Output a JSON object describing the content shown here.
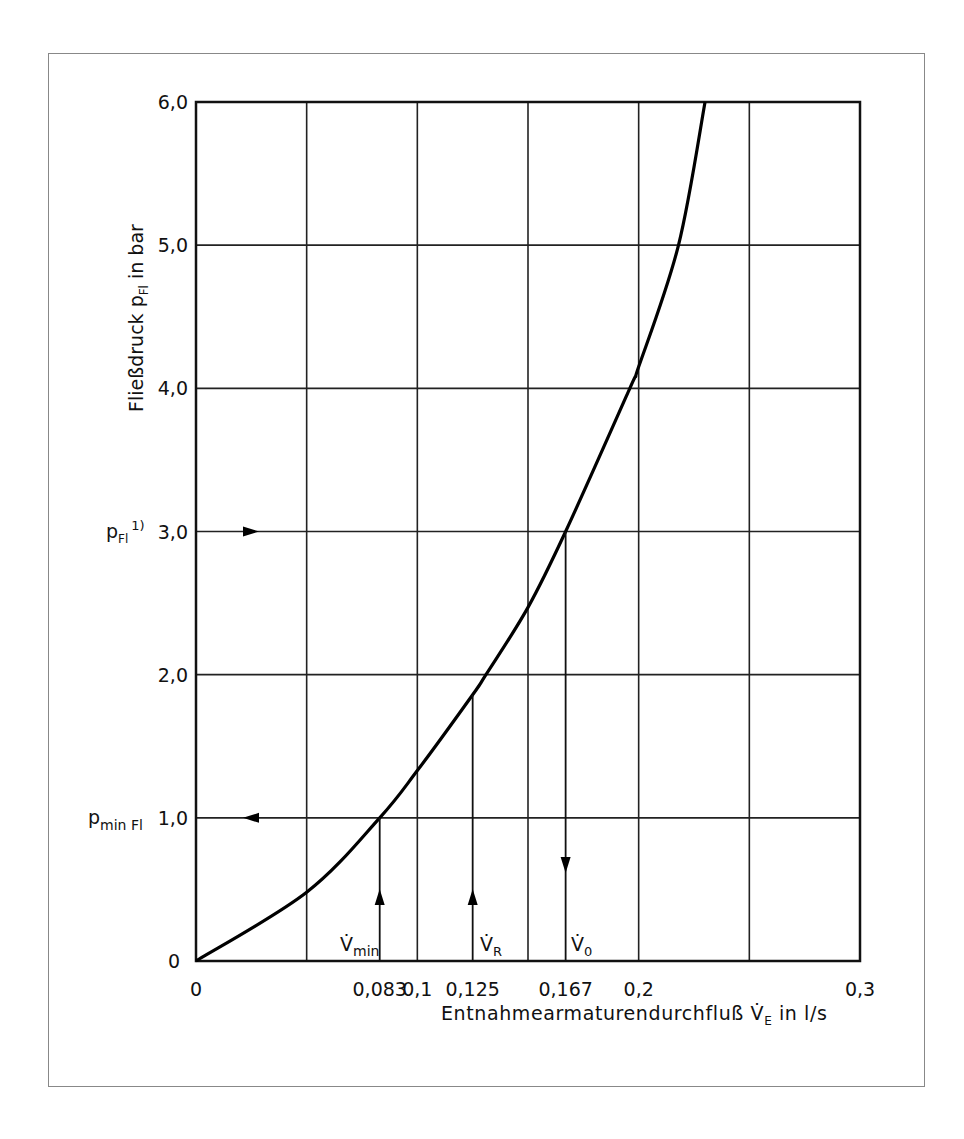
{
  "chart_data": {
    "type": "line",
    "title": "",
    "xlabel": "Entnahmearmaturendurchfluß V̇E in l/s",
    "ylabel": "Fließdruck pFl in bar",
    "xlim": [
      0,
      0.3
    ],
    "ylim": [
      0,
      6.0
    ],
    "grid": true,
    "grid_x": [
      0,
      0.05,
      0.1,
      0.15,
      0.2,
      0.25,
      0.3
    ],
    "grid_y": [
      0,
      1,
      2,
      3,
      4,
      5,
      6
    ],
    "x_tick_labels": [
      "0",
      "0,083",
      "0,1",
      "0,125",
      "0,167",
      "0,2",
      "0,3"
    ],
    "x_tick_values": [
      0,
      0.083,
      0.1,
      0.125,
      0.167,
      0.2,
      0.3
    ],
    "y_tick_labels": [
      "0",
      "1,0",
      "2,0",
      "3,0",
      "4,0",
      "5,0",
      "6,0"
    ],
    "y_tick_values": [
      0,
      1,
      2,
      3,
      4,
      5,
      6
    ],
    "series": [
      {
        "name": "Fließdruck-Durchfluss-Kennlinie",
        "x": [
          0,
          0.05,
          0.083,
          0.1,
          0.125,
          0.131,
          0.15,
          0.167,
          0.196,
          0.2,
          0.218,
          0.23
        ],
        "values": [
          0,
          0.48,
          1.0,
          1.33,
          1.86,
          2.0,
          2.47,
          3.0,
          4.0,
          4.15,
          5.0,
          6.0
        ]
      }
    ],
    "annotations": [
      {
        "label": "V̇min",
        "x": 0.083,
        "arrow": "up",
        "from_y": 0,
        "to_y": 1.0
      },
      {
        "label": "V̇R",
        "x": 0.125,
        "arrow": "up",
        "from_y": 0,
        "to_y": 1.86
      },
      {
        "label": "V̇0",
        "x": 0.167,
        "arrow": "down",
        "from_y": 3.0,
        "to_y": 0
      },
      {
        "label": "pFl 1)",
        "y": 3.0,
        "arrow": "right"
      },
      {
        "label": "pminFl",
        "y": 1.0,
        "arrow": "left"
      }
    ]
  },
  "axes": {
    "ylabel_main": "Fließdruck p",
    "ylabel_sub": "Fl",
    "ylabel_unit": " in bar",
    "xlabel_main": "Entnahmearmaturendurchfluß V̇",
    "xlabel_sub": "E",
    "xlabel_unit": " in l/s",
    "y_origin_label": "0",
    "x_origin_label": "0"
  },
  "markers": {
    "pfl_main": "p",
    "pfl_sub": "Fl",
    "pfl_sup": "1)",
    "pmin_main": "p",
    "pmin_sub": "min Fl",
    "vmin_main": "V̇",
    "vmin_sub": "min",
    "vr_main": "V̇",
    "vr_sub": "R",
    "v0_main": "V̇",
    "v0_sub": "0"
  }
}
